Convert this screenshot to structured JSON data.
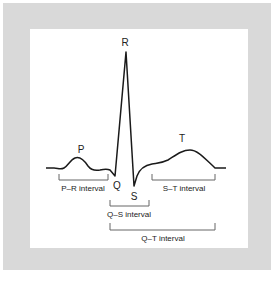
{
  "diagram": {
    "type": "ECG waveform",
    "waves": {
      "P": "P",
      "Q": "Q",
      "R": "R",
      "S": "S",
      "T": "T"
    },
    "intervals": {
      "pr": "P–R interval",
      "qs": "Q–S interval",
      "st": "S–T interval",
      "qt": "Q–T interval"
    },
    "colors": {
      "frame": "#d9d9d9",
      "panel": "#ffffff",
      "trace": "#1a1a1a",
      "bracket": "#666666"
    }
  }
}
